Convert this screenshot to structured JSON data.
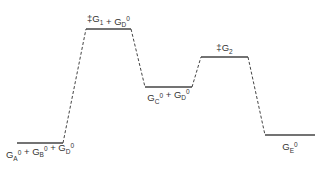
{
  "diagram": {
    "type": "energy-profile",
    "levels": [
      {
        "id": "reactants",
        "label": {
          "parts": [
            {
              "t": "G",
              "s": "A",
              "p": "0"
            },
            {
              "t": " + "
            },
            {
              "t": "G",
              "s": "B",
              "p": "0"
            },
            {
              "t": " + "
            },
            {
              "t": "G",
              "s": "D",
              "p": "0"
            }
          ]
        },
        "x1": 17,
        "x2": 63,
        "y": 143
      },
      {
        "id": "ts1",
        "label": {
          "parts": [
            {
              "t": "‡G",
              "s": "1"
            },
            {
              "t": " + "
            },
            {
              "t": "G",
              "s": "D",
              "p": "0"
            }
          ]
        },
        "x1": 86,
        "x2": 131,
        "y": 29
      },
      {
        "id": "intermediate",
        "label": {
          "parts": [
            {
              "t": "G",
              "s": "C",
              "p": "0"
            },
            {
              "t": " + "
            },
            {
              "t": "G",
              "s": "D",
              "p": "0"
            }
          ]
        },
        "x1": 145,
        "x2": 192,
        "y": 87
      },
      {
        "id": "ts2",
        "label": {
          "parts": [
            {
              "t": "‡G",
              "s": "2"
            }
          ]
        },
        "x1": 201,
        "x2": 248,
        "y": 57
      },
      {
        "id": "products",
        "label": {
          "parts": [
            {
              "t": "G",
              "s": "E",
              "p": "0"
            }
          ]
        },
        "x1": 265,
        "x2": 315,
        "y": 135
      }
    ],
    "labels_text": {
      "reactants": "GA0 + GB0 + GD0",
      "ts1": "‡G1 + GD0",
      "intermediate": "GC0 + GD0",
      "ts2": "‡G2",
      "products": "GE0"
    },
    "line_color": "#444444"
  }
}
